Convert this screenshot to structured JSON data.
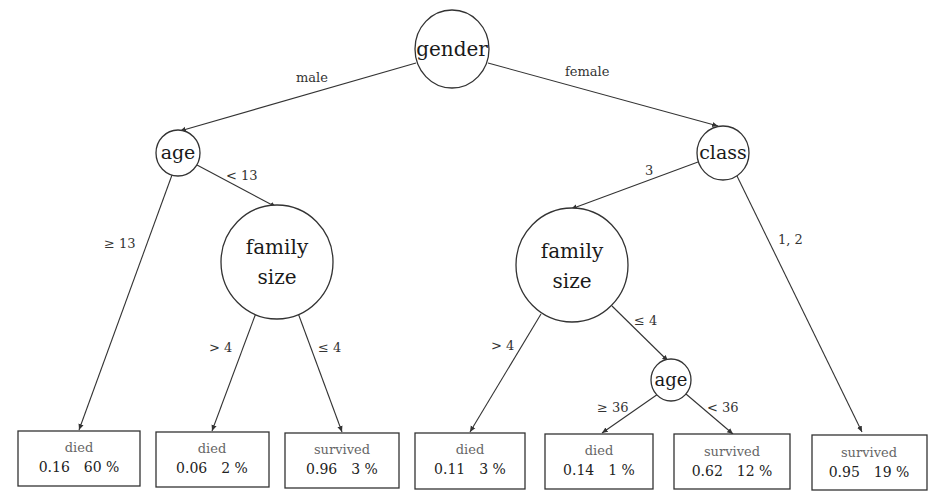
{
  "diagram": {
    "type": "decision-tree",
    "nodes": {
      "root": {
        "label": "gender"
      },
      "age_male": {
        "label": "age"
      },
      "class_female": {
        "label": "class"
      },
      "family_left": {
        "line1": "family",
        "line2": "size"
      },
      "family_right": {
        "line1": "family",
        "line2": "size"
      },
      "age_female": {
        "label": "age"
      }
    },
    "edges": {
      "male": "male",
      "female": "female",
      "age_ge13": "≥ 13",
      "age_lt13": "< 13",
      "fam_left_gt4": "> 4",
      "fam_left_le4": "≤ 4",
      "class_3": "3",
      "class_12": "1, 2",
      "fam_right_gt4": "> 4",
      "fam_right_le4": "≤ 4",
      "age_ge36": "≥ 36",
      "age_lt36": "< 36"
    },
    "leaves": [
      {
        "class": "died",
        "prob": "0.16",
        "pct": "60 %"
      },
      {
        "class": "died",
        "prob": "0.06",
        "pct": "2 %"
      },
      {
        "class": "survived",
        "prob": "0.96",
        "pct": "3 %"
      },
      {
        "class": "died",
        "prob": "0.11",
        "pct": "3 %"
      },
      {
        "class": "died",
        "prob": "0.14",
        "pct": "1 %"
      },
      {
        "class": "survived",
        "prob": "0.62",
        "pct": "12 %"
      },
      {
        "class": "survived",
        "prob": "0.95",
        "pct": "19 %"
      }
    ]
  }
}
